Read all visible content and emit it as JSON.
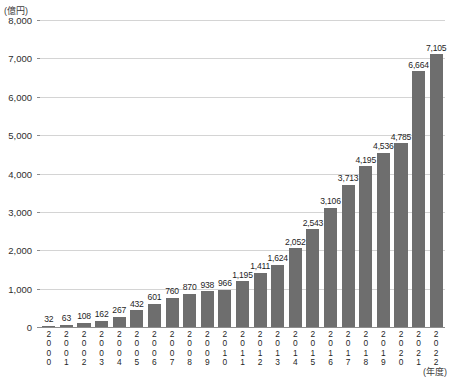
{
  "chart_data": {
    "type": "bar",
    "title": "",
    "subtitle": "",
    "xlabel": "(年度)",
    "ylabel": "(億円)",
    "ylim": [
      0,
      8000
    ],
    "ytick_step": 1000,
    "grid": true,
    "legend": "none",
    "bar_color": "#6e6e6e",
    "gridline_color": "#d4d4d4",
    "axis_color": "#8d8d8d",
    "categories": [
      "2000",
      "2001",
      "2002",
      "2003",
      "2004",
      "2005",
      "2006",
      "2007",
      "2008",
      "2009",
      "2010",
      "2011",
      "2012",
      "2013",
      "2014",
      "2015",
      "2016",
      "2017",
      "2018",
      "2019",
      "2020",
      "2021",
      "2022"
    ],
    "values": [
      32,
      63,
      108,
      162,
      267,
      432,
      601,
      760,
      870,
      938,
      966,
      1195,
      1411,
      1624,
      2052,
      2543,
      3106,
      3713,
      4195,
      4536,
      4785,
      6664,
      7105
    ],
    "value_labels": [
      "32",
      "63",
      "108",
      "162",
      "267",
      "432",
      "601",
      "760",
      "870",
      "938",
      "966",
      "1,195",
      "1,411",
      "1,624",
      "2,052",
      "2,543",
      "3,106",
      "3,713",
      "4,195",
      "4,536",
      "4,785",
      "6,664",
      "7,105"
    ],
    "ytick_labels": [
      "0",
      "1,000",
      "2,000",
      "3,000",
      "4,000",
      "5,000",
      "6,000",
      "7,000",
      "8,000"
    ],
    "ytick_values": [
      0,
      1000,
      2000,
      3000,
      4000,
      5000,
      6000,
      7000,
      8000
    ]
  }
}
